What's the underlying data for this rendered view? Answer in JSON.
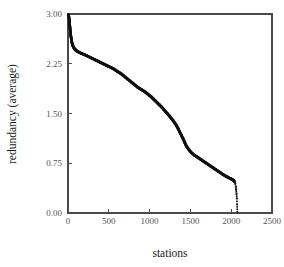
{
  "chart_data": {
    "type": "scatter",
    "title": "",
    "xlabel": "stations",
    "ylabel": "redundancy (average)",
    "xlim": [
      0,
      2500
    ],
    "ylim": [
      0.0,
      3.0
    ],
    "xticks": [
      0,
      500,
      1000,
      1500,
      2000,
      2500
    ],
    "xtick_labels": [
      "0",
      "500",
      "1000",
      "1500",
      "2000",
      "2500"
    ],
    "yticks": [
      0.0,
      0.75,
      1.5,
      2.25,
      3.0
    ],
    "ytick_labels": [
      "0.00",
      "0.75",
      "1.50",
      "2.25",
      "3.00"
    ],
    "grid": false,
    "legend": false,
    "marker": "filled-square",
    "marker_color": "#111111",
    "series": [
      {
        "name": "redundancy (average)",
        "x": [
          5,
          12,
          18,
          24,
          30,
          36,
          42,
          48,
          54,
          60,
          68,
          76,
          85,
          95,
          105,
          118,
          132,
          148,
          165,
          185,
          205,
          230,
          255,
          280,
          305,
          330,
          355,
          380,
          405,
          430,
          455,
          480,
          505,
          530,
          555,
          580,
          605,
          630,
          655,
          680,
          705,
          730,
          755,
          780,
          805,
          830,
          855,
          880,
          900,
          920,
          945,
          970,
          995,
          1020,
          1045,
          1070,
          1095,
          1120,
          1145,
          1170,
          1195,
          1220,
          1245,
          1270,
          1290,
          1310,
          1330,
          1350,
          1370,
          1390,
          1410,
          1430,
          1450,
          1475,
          1500,
          1525,
          1550,
          1575,
          1600,
          1630,
          1660,
          1690,
          1720,
          1750,
          1780,
          1810,
          1840,
          1870,
          1900,
          1925,
          1950,
          1970,
          1990,
          2005,
          2020,
          2032,
          2042,
          2050,
          2056,
          2061,
          2065,
          2069,
          2072,
          2075
        ],
        "y": [
          2.99,
          2.95,
          2.88,
          2.8,
          2.72,
          2.66,
          2.61,
          2.57,
          2.54,
          2.52,
          2.5,
          2.48,
          2.47,
          2.455,
          2.445,
          2.435,
          2.425,
          2.415,
          2.405,
          2.395,
          2.385,
          2.37,
          2.355,
          2.34,
          2.325,
          2.31,
          2.295,
          2.28,
          2.265,
          2.25,
          2.235,
          2.22,
          2.205,
          2.19,
          2.175,
          2.155,
          2.135,
          2.115,
          2.095,
          2.07,
          2.045,
          2.02,
          1.995,
          1.97,
          1.945,
          1.92,
          1.895,
          1.875,
          1.86,
          1.845,
          1.825,
          1.8,
          1.775,
          1.75,
          1.72,
          1.69,
          1.66,
          1.63,
          1.6,
          1.565,
          1.53,
          1.495,
          1.46,
          1.42,
          1.39,
          1.355,
          1.315,
          1.27,
          1.22,
          1.17,
          1.12,
          1.065,
          1.01,
          0.965,
          0.925,
          0.895,
          0.87,
          0.85,
          0.83,
          0.805,
          0.78,
          0.755,
          0.73,
          0.705,
          0.68,
          0.655,
          0.63,
          0.605,
          0.58,
          0.56,
          0.545,
          0.53,
          0.52,
          0.51,
          0.5,
          0.49,
          0.47,
          0.44,
          0.4,
          0.35,
          0.29,
          0.22,
          0.13,
          0.02
        ]
      }
    ]
  },
  "figure": {
    "background": "#ffffff",
    "axis_color": "#4a4a4a",
    "tick_label_color": "#555555",
    "axis_title_color": "#1a1a1a"
  }
}
